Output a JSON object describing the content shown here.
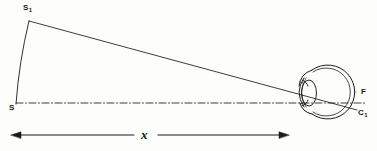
{
  "figure": {
    "background_color": "#fdfdfc",
    "ink_color": "#1b1b1b",
    "width": 377,
    "height": 151,
    "labels": {
      "object_top": "S",
      "object_top_sub": "1",
      "object_bottom": "S",
      "fovea": "F",
      "image_point": "C",
      "image_point_sub": "1",
      "distance": "x"
    },
    "dimension": {
      "label": "x",
      "arrow_left_x": 12,
      "arrow_right_x": 288,
      "y": 135,
      "style": "double-headed-arrow"
    },
    "axis": {
      "name": "optic-axis",
      "style": "dash-dot",
      "from_x": 16,
      "to_x": 366,
      "y": 103
    },
    "object_arc": {
      "name": "object-arc",
      "from": [
        16,
        104
      ],
      "to": [
        29,
        21
      ],
      "curvature": "slight-convex-left"
    },
    "chief_ray": {
      "name": "chief-ray",
      "from": [
        29,
        21
      ],
      "to": [
        357,
        110
      ]
    },
    "eye": {
      "name": "eye",
      "center_x": 329,
      "center_y": 92,
      "radius": 27,
      "has_double_wall": true,
      "parts": [
        "sclera-outer",
        "sclera-inner",
        "cornea",
        "lens",
        "iris-upper",
        "iris-lower",
        "retina"
      ]
    }
  }
}
